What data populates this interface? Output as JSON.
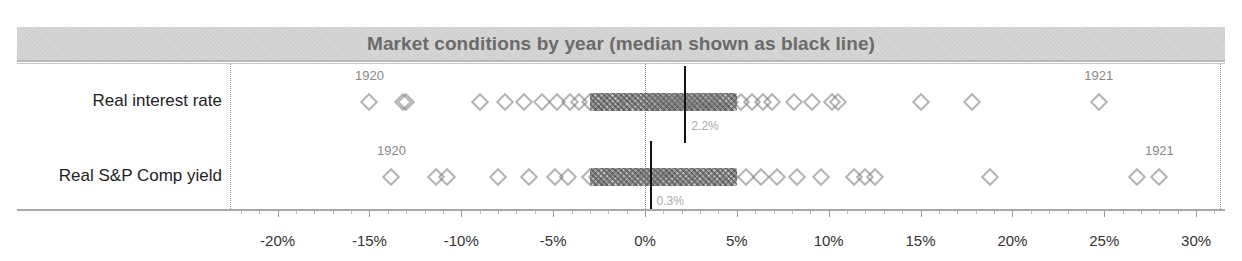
{
  "chart_data": {
    "type": "scatter",
    "subtype": "strip-plot",
    "title": "Market conditions by year (median shown as black line)",
    "xlabel": "",
    "ylabel": "",
    "xlim": [
      -22.5,
      31
    ],
    "x_ticks": [
      "-20%",
      "-15%",
      "-10%",
      "-5%",
      "0%",
      "5%",
      "10%",
      "15%",
      "20%",
      "25%",
      "30%"
    ],
    "x_tick_values": [
      -20,
      -15,
      -10,
      -5,
      0,
      5,
      10,
      15,
      20,
      25,
      30
    ],
    "marker": "hollow diamond",
    "reference_line": 0,
    "series": [
      {
        "name": "Real interest rate",
        "median": 2.2,
        "median_label": "2.2%",
        "annotations": [
          {
            "label": "1920",
            "value": -15.0
          },
          {
            "label": "1921",
            "value": 24.7
          }
        ],
        "values": [
          -15.0,
          -13.2,
          -13.0,
          -9.0,
          -7.6,
          -6.6,
          -5.6,
          -4.8,
          -4.1,
          -3.6,
          -3.0,
          -2.5,
          -2.0,
          -1.5,
          -1.0,
          -0.5,
          0.0,
          0.3,
          0.6,
          0.9,
          1.2,
          1.5,
          1.8,
          2.0,
          2.2,
          2.4,
          2.7,
          3.0,
          3.3,
          3.6,
          3.9,
          4.2,
          4.6,
          5.2,
          5.8,
          6.4,
          6.9,
          8.1,
          9.1,
          10.2,
          10.5,
          15.0,
          17.8,
          24.7
        ]
      },
      {
        "name": "Real S&P Comp yield",
        "median": 0.3,
        "median_label": "0.3%",
        "annotations": [
          {
            "label": "1920",
            "value": -13.8
          },
          {
            "label": "1921",
            "value": 28.0
          }
        ],
        "values": [
          -13.8,
          -11.4,
          -10.8,
          -8.0,
          -6.3,
          -4.9,
          -4.2,
          -3.0,
          -2.6,
          -2.2,
          -1.8,
          -1.4,
          -1.0,
          -0.6,
          -0.2,
          0.1,
          0.3,
          0.6,
          0.9,
          1.3,
          1.7,
          2.1,
          2.5,
          3.0,
          3.5,
          4.0,
          4.6,
          5.5,
          6.3,
          7.2,
          8.3,
          9.6,
          11.4,
          12.0,
          12.5,
          18.8,
          26.8,
          28.0
        ]
      }
    ],
    "dense_ranges": [
      {
        "series": "Real interest rate",
        "from": -3.0,
        "to": 5.0
      },
      {
        "series": "Real S&P Comp yield",
        "from": -3.0,
        "to": 5.0
      }
    ],
    "grid": false,
    "legend": "none"
  }
}
